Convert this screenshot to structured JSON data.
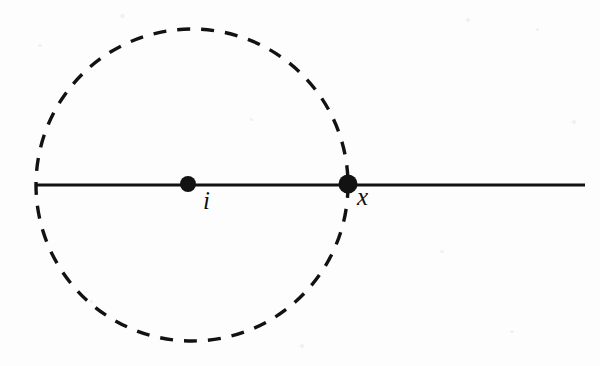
{
  "figure": {
    "type": "geometric-diagram",
    "background_color": "#fdfdfd",
    "ink_color": "#121212",
    "elements": {
      "horizontal_line": {
        "name": "horizontal-line",
        "style": "solid",
        "x1": 36,
        "y1": 185,
        "x2": 585,
        "y2": 185,
        "stroke_width": 3.2
      },
      "circle": {
        "name": "dashed-circle",
        "style": "dashed",
        "cx": 192,
        "cy": 185,
        "r": 156,
        "stroke_width": 3.4,
        "dash_length": 13,
        "gap_length": 11
      },
      "points": [
        {
          "id": "i",
          "label": "i",
          "cx": 188,
          "cy": 184,
          "r": 8,
          "role": "circle-center"
        },
        {
          "id": "x",
          "label": "x",
          "cx": 348,
          "cy": 184,
          "r": 9.5,
          "role": "circle-line-intersection"
        }
      ]
    }
  },
  "labels": {
    "center_point": "i",
    "intersection_point": "x"
  }
}
